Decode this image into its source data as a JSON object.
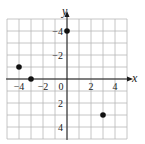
{
  "chart_data": {
    "type": "scatter",
    "title": "",
    "xlabel": "x",
    "ylabel": "y",
    "xlim": [
      -5,
      5
    ],
    "ylim": [
      -5,
      5
    ],
    "grid": true,
    "x_ticks": [
      -4,
      -2,
      0,
      2,
      4
    ],
    "y_ticks": [
      -4,
      -2,
      2,
      4
    ],
    "tick_labels_x": [
      "−4",
      "−2",
      "0",
      "2",
      "4"
    ],
    "tick_labels_y": [
      "4",
      "2",
      "−2",
      "−4"
    ],
    "points": [
      {
        "x": -4,
        "y": 1
      },
      {
        "x": -3,
        "y": 0
      },
      {
        "x": 0,
        "y": 4
      },
      {
        "x": 3,
        "y": -3
      }
    ],
    "colors": {
      "grid": "#b8b8b8",
      "axis": "#1a1a1a",
      "point": "#111111"
    }
  }
}
